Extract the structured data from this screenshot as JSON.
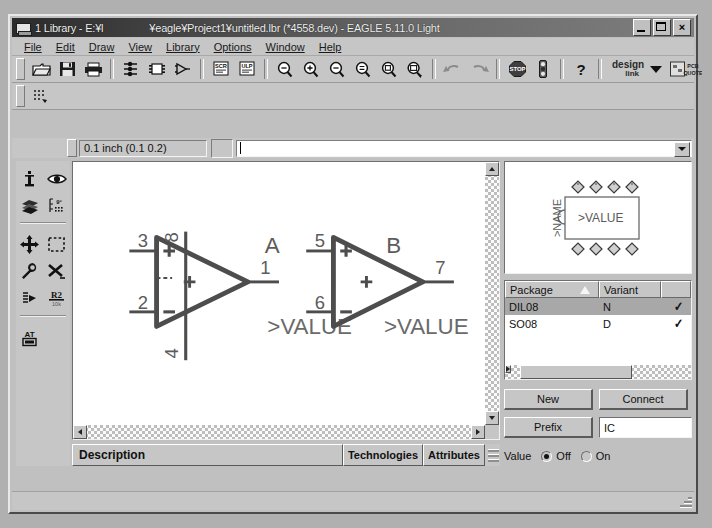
{
  "window": {
    "title_main": "1 Library - E:¥l",
    "title_path": "¥eagle¥Project1¥untitled.lbr (*4558.dev) - EAGLE 5.11.0 Light",
    "icon": "library-window-icon",
    "buttons": {
      "minimize": "_",
      "maximize": "□",
      "close": "×"
    }
  },
  "menu": {
    "items": [
      {
        "label": "File"
      },
      {
        "label": "Edit"
      },
      {
        "label": "Draw"
      },
      {
        "label": "View"
      },
      {
        "label": "Library"
      },
      {
        "label": "Options"
      },
      {
        "label": "Window"
      },
      {
        "label": "Help"
      }
    ]
  },
  "toolbar": {
    "buttons": [
      {
        "name": "open-icon",
        "tip": "Open"
      },
      {
        "name": "save-icon",
        "tip": "Save"
      },
      {
        "name": "print-icon",
        "tip": "Print"
      },
      {
        "name": "symbol-edit-icon",
        "tip": "Edit symbol"
      },
      {
        "name": "package-edit-icon",
        "tip": "Edit package"
      },
      {
        "name": "device-edit-icon",
        "tip": "Edit device"
      },
      {
        "name": "script-icon",
        "tip": "Execute script (SCR)"
      },
      {
        "name": "ulp-icon",
        "tip": "Run ULP"
      },
      {
        "name": "zoom-fit-icon",
        "tip": "Zoom to fit"
      },
      {
        "name": "zoom-in-icon",
        "tip": "Zoom in"
      },
      {
        "name": "zoom-out-icon",
        "tip": "Zoom out"
      },
      {
        "name": "zoom-redraw-icon",
        "tip": "Redraw"
      },
      {
        "name": "zoom-select-icon",
        "tip": "Zoom select"
      },
      {
        "name": "camera-icon",
        "tip": "Export image"
      },
      {
        "name": "undo-icon",
        "tip": "Undo"
      },
      {
        "name": "redo-icon",
        "tip": "Redo"
      },
      {
        "name": "stop-icon",
        "tip": "Stop"
      },
      {
        "name": "traffic-light-icon",
        "tip": "DRC"
      },
      {
        "name": "help-icon",
        "tip": "Help"
      }
    ],
    "design_link": {
      "line1": "design",
      "line2": "link"
    },
    "pcb_quote": {
      "line1": "PCB",
      "line2": "QUOTE"
    }
  },
  "coordbar": {
    "grid_value": "0.1 inch (0.1 0.2)",
    "command_value": "",
    "command_placeholder": ""
  },
  "palette": {
    "tools": [
      {
        "name": "info-tool",
        "label": "Info"
      },
      {
        "name": "show-tool",
        "label": "Show"
      },
      {
        "name": "layers-tool",
        "label": "Display"
      },
      {
        "name": "grid-tool",
        "label": "Grid"
      },
      {
        "name": "move-tool",
        "label": "Move"
      },
      {
        "name": "group-tool",
        "label": "Group"
      },
      {
        "name": "change-tool",
        "label": "Change"
      },
      {
        "name": "delete-tool",
        "label": "Delete"
      },
      {
        "name": "paste-tool",
        "label": "Paste"
      },
      {
        "name": "rename-tool",
        "label": "Name"
      },
      {
        "name": "text-tool",
        "label": "Text"
      }
    ]
  },
  "canvas": {
    "symbols": [
      {
        "designator": "A",
        "value_label": ">VALUE",
        "pins": [
          {
            "number": "3",
            "marking": "+",
            "side": "left-top"
          },
          {
            "number": "2",
            "marking": "−",
            "side": "left-bottom"
          },
          {
            "number": "1",
            "marking": "",
            "side": "right"
          },
          {
            "number": "8",
            "marking": "",
            "side": "top"
          },
          {
            "number": "4",
            "marking": "",
            "side": "bottom"
          }
        ],
        "center_marking": "+"
      },
      {
        "designator": "B",
        "value_label": ">VALUE",
        "pins": [
          {
            "number": "5",
            "marking": "+",
            "side": "left-top"
          },
          {
            "number": "6",
            "marking": "−",
            "side": "left-bottom"
          },
          {
            "number": "7",
            "marking": "",
            "side": "right"
          }
        ],
        "center_marking": "+"
      }
    ]
  },
  "preview": {
    "name_label": ">NAME",
    "value_label": ">VALUE",
    "pads_top": 4,
    "pads_bottom": 4
  },
  "package_table": {
    "columns": [
      "Package",
      "Variant",
      ""
    ],
    "sort_column": "Package",
    "rows": [
      {
        "package": "DIL08",
        "variant": "N",
        "connected": "✓",
        "selected": true
      },
      {
        "package": "SO08",
        "variant": "D",
        "connected": "✓",
        "selected": false
      }
    ]
  },
  "device_controls": {
    "new_button": "New",
    "connect_button": "Connect",
    "prefix_button": "Prefix",
    "prefix_value": "IC",
    "value_label": "Value",
    "value_off": "Off",
    "value_on": "On",
    "value_selected": "Off"
  },
  "bottom": {
    "description_button": "Description",
    "technologies_button": "Technologies",
    "attributes_button": "Attributes"
  },
  "colors": {
    "face": "#c6c6c6",
    "title_dark": "#2b2b2b",
    "selection": "#a8a8a8",
    "canvas": "#ffffff",
    "ink": "#4a4a4a"
  }
}
